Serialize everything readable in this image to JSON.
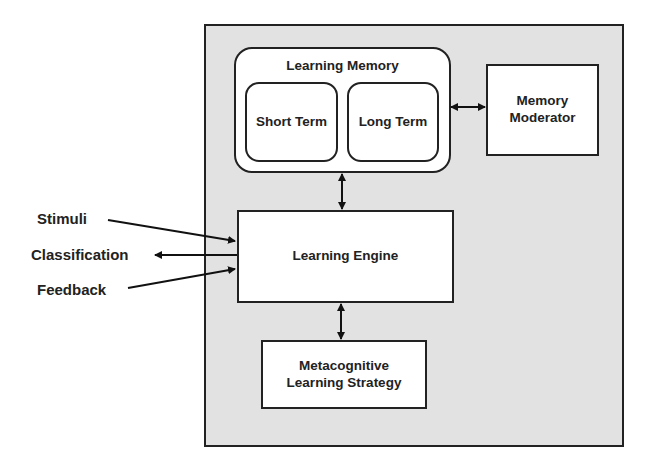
{
  "diagram": {
    "container": {
      "label": ""
    },
    "learning_memory": {
      "title": "Learning Memory",
      "short_term": "Short Term",
      "long_term": "Long Term"
    },
    "memory_moderator": {
      "line1": "Memory",
      "line2": "Moderator"
    },
    "learning_engine": {
      "label": "Learning Engine"
    },
    "metacognitive": {
      "line1": "Metacognitive",
      "line2": "Learning Strategy"
    },
    "external": {
      "stimuli": "Stimuli",
      "classification": "Classification",
      "feedback": "Feedback"
    },
    "connections": [
      {
        "from": "Learning Memory",
        "to": "Memory Moderator",
        "type": "bidirectional"
      },
      {
        "from": "Learning Memory",
        "to": "Learning Engine",
        "type": "bidirectional"
      },
      {
        "from": "Learning Engine",
        "to": "Metacognitive Learning Strategy",
        "type": "bidirectional"
      },
      {
        "from": "Stimuli",
        "to": "Learning Engine",
        "type": "input"
      },
      {
        "from": "Learning Engine",
        "to": "Classification",
        "type": "output"
      },
      {
        "from": "Feedback",
        "to": "Learning Engine",
        "type": "input"
      }
    ],
    "colors": {
      "container_fill": "#e2e2e2",
      "box_fill": "#ffffff",
      "stroke": "#222222"
    }
  }
}
